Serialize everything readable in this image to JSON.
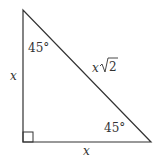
{
  "diagram": {
    "type": "right-isosceles-triangle",
    "stroke_color": "#333333",
    "labels": {
      "top_angle": "45°",
      "bottom_right_angle": "45°",
      "left_side": "x",
      "bottom_side": "x",
      "hypotenuse_var": "x",
      "hypotenuse_radicand": "2"
    }
  }
}
